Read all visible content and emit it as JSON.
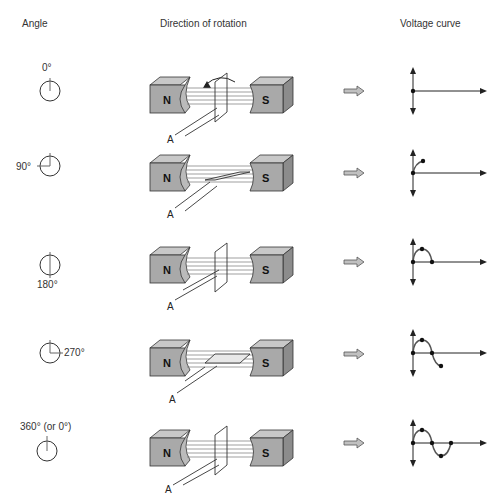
{
  "headers": {
    "angle": "Angle",
    "direction": "Direction of rotation",
    "voltage": "Voltage curve"
  },
  "colors": {
    "magnet_face": "#a9a9a9",
    "magnet_top": "#c8c8c8",
    "magnet_side": "#8c8c8c",
    "arrow_fill": "#c0c0c0",
    "line": "#222222",
    "curve": "#555555"
  },
  "magnet_labels": {
    "north": "N",
    "south": "S"
  },
  "conductor_label": "A",
  "rows": [
    {
      "angle_label": "0°",
      "angle_deg": 0,
      "coil": "vertical",
      "curve_points": 1
    },
    {
      "angle_label": "90°",
      "angle_deg": 90,
      "coil": "horizontal",
      "curve_points": 2
    },
    {
      "angle_label": "180°",
      "angle_deg": 180,
      "coil": "vertical",
      "curve_points": 3
    },
    {
      "angle_label": "270°",
      "angle_deg": 270,
      "coil": "horizontal",
      "curve_points": 4
    },
    {
      "angle_label": "360° (or 0°)",
      "angle_deg": 360,
      "coil": "vertical",
      "curve_points": 5
    }
  ],
  "rotation_arrow": "counter-clockwise"
}
